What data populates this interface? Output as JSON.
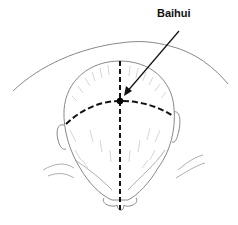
{
  "figure": {
    "label": "Baihui",
    "colors": {
      "outline": "#888888",
      "hair": "#bbbbbb",
      "dashed_lines": "#111111",
      "point": "#000000",
      "arrow": "#111111"
    },
    "point": {
      "x": 120,
      "y": 101
    },
    "arrow": {
      "from": {
        "x": 179,
        "y": 31
      },
      "to": {
        "x": 124,
        "y": 95
      }
    }
  }
}
